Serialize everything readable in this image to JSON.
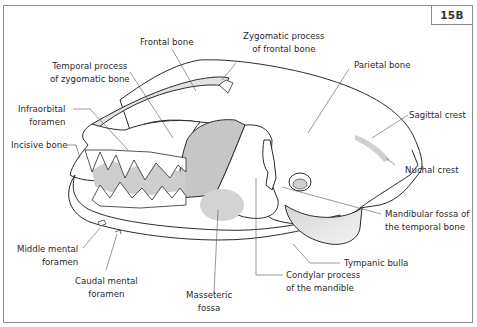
{
  "figure": {
    "id": "15B",
    "colors": {
      "outline": "#2b2b2b",
      "bone_fill": "#ffffff",
      "shade_light": "#e4e4e4",
      "shade_mid": "#c9c9c9",
      "leader_line": "#555555",
      "frame": "#8a8a8a"
    }
  },
  "labels": [
    {
      "key": "frontal_bone",
      "lines": [
        "Frontal bone"
      ]
    },
    {
      "key": "zygomatic_process_frontal",
      "lines": [
        "Zygomatic process",
        "of frontal bone"
      ]
    },
    {
      "key": "temporal_process_zygomatic",
      "lines": [
        "Temporal process",
        "of zygomatic bone"
      ]
    },
    {
      "key": "parietal_bone",
      "lines": [
        "Parietal bone"
      ]
    },
    {
      "key": "infraorbital_foramen",
      "lines": [
        "Infraorbital",
        "foramen"
      ]
    },
    {
      "key": "sagittal_crest",
      "lines": [
        "Sagittal crest"
      ]
    },
    {
      "key": "incisive_bone",
      "lines": [
        "Incisive bone"
      ]
    },
    {
      "key": "nuchal_crest",
      "lines": [
        "Nuchal crest"
      ]
    },
    {
      "key": "mandibular_fossa",
      "lines": [
        "Mandibular fossa of",
        "the temporal bone"
      ]
    },
    {
      "key": "tympanic_bulla",
      "lines": [
        "Tympanic bulla"
      ]
    },
    {
      "key": "middle_mental_foramen",
      "lines": [
        "Middle mental",
        "foramen"
      ]
    },
    {
      "key": "caudal_mental_foramen",
      "lines": [
        "Caudal mental",
        "foramen"
      ]
    },
    {
      "key": "condylar_process",
      "lines": [
        "Condylar process",
        "of the mandible"
      ]
    },
    {
      "key": "masseteric_fossa",
      "lines": [
        "Masseteric",
        "fossa"
      ]
    }
  ]
}
